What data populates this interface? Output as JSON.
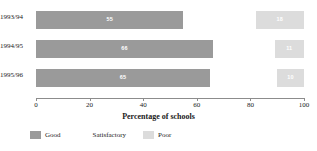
{
  "chart_data": {
    "type": "bar",
    "orientation": "horizontal",
    "stacked": true,
    "title": "",
    "xlabel": "Percentage of schools",
    "ylabel": "",
    "xlim": [
      0,
      100
    ],
    "xticks": [
      0,
      20,
      40,
      60,
      80,
      100
    ],
    "xtick_labels": [
      "0",
      "20",
      "40",
      "60",
      "80",
      "100"
    ],
    "grid": false,
    "legend_position": "bottom-left",
    "categories": [
      "1993/94",
      "1994/95",
      "1995/96"
    ],
    "series": [
      {
        "name": "Good",
        "color": "#9a9a9a",
        "values": [
          55,
          66,
          65
        ]
      },
      {
        "name": "Satisfactory",
        "color": "#ffffff",
        "values": [
          27,
          23,
          25
        ]
      },
      {
        "name": "Poor",
        "color": "#dcdcdc",
        "values": [
          18,
          11,
          10
        ]
      }
    ],
    "bar_labels": {
      "good": [
        "55",
        "66",
        "65"
      ],
      "satisfactory": [
        "",
        "",
        ""
      ],
      "poor": [
        "18",
        "11",
        "10"
      ]
    }
  },
  "axis": {
    "title": "Percentage of schools",
    "ticks": [
      "0",
      "20",
      "40",
      "60",
      "80",
      "100"
    ]
  },
  "rows": [
    {
      "category": "1993/94",
      "good": "55",
      "satisfactory": "",
      "poor": "18"
    },
    {
      "category": "1994/95",
      "good": "66",
      "satisfactory": "",
      "poor": "11"
    },
    {
      "category": "1995/96",
      "good": "65",
      "satisfactory": "",
      "poor": "10"
    }
  ],
  "legend": {
    "items": [
      {
        "label": "Good",
        "color": "#9a9a9a"
      },
      {
        "label": "Satisfactory",
        "color": "#ffffff"
      },
      {
        "label": "Poor",
        "color": "#dcdcdc"
      }
    ]
  }
}
